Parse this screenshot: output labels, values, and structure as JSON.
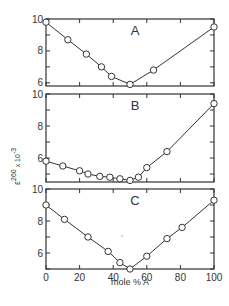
{
  "figure": {
    "y_axis_label_main": "ε",
    "y_axis_label_sup": "260",
    "y_axis_label_sub": "P",
    "y_axis_label_tail": " x 10",
    "y_axis_label_exp": "-3",
    "x_axis_label": "mole % A"
  },
  "chart_data": [
    {
      "type": "line",
      "title": "A",
      "xlabel": "mole % A",
      "ylabel": "ε_P^260 x 10^-3",
      "xlim": [
        0,
        100
      ],
      "ylim": [
        5.8,
        10
      ],
      "yticks": [
        6,
        8,
        10
      ],
      "xticks": [
        0,
        20,
        40,
        60,
        80,
        100
      ],
      "grid": false,
      "marker": "open-circle",
      "series": [
        {
          "name": "A",
          "x": [
            0,
            13,
            24,
            33,
            39,
            50,
            64,
            100
          ],
          "y": [
            9.8,
            8.7,
            7.8,
            7.0,
            6.4,
            5.9,
            6.8,
            9.5
          ]
        }
      ]
    },
    {
      "type": "line",
      "title": "B",
      "xlabel": "mole % A",
      "ylabel": "ε_P^260 x 10^-3",
      "xlim": [
        0,
        100
      ],
      "ylim": [
        4.5,
        10
      ],
      "yticks": [
        6,
        8,
        10
      ],
      "xticks": [
        0,
        20,
        40,
        60,
        80,
        100
      ],
      "grid": false,
      "marker": "open-circle",
      "series": [
        {
          "name": "B",
          "x": [
            0,
            10,
            20,
            25,
            32,
            38,
            44,
            50,
            55,
            60,
            72,
            100
          ],
          "y": [
            5.8,
            5.5,
            5.2,
            5.0,
            4.85,
            4.8,
            4.7,
            4.6,
            4.8,
            5.4,
            6.4,
            9.4
          ]
        }
      ]
    },
    {
      "type": "line",
      "title": "C",
      "xlabel": "mole % A",
      "ylabel": "ε_P^260 x 10^-3",
      "xlim": [
        0,
        100
      ],
      "ylim": [
        5,
        10
      ],
      "yticks": [
        6,
        8,
        10
      ],
      "xticks": [
        0,
        20,
        40,
        60,
        80,
        100
      ],
      "xticklabels": [
        "0",
        "20",
        "40",
        "60",
        "80",
        "100"
      ],
      "grid": false,
      "marker": "open-circle",
      "series": [
        {
          "name": "C",
          "x": [
            0,
            11,
            25,
            37,
            44,
            50,
            60,
            72,
            81,
            100
          ],
          "y": [
            9.0,
            8.1,
            7.0,
            6.1,
            5.4,
            5.0,
            5.8,
            6.9,
            7.6,
            9.3
          ]
        }
      ]
    }
  ]
}
